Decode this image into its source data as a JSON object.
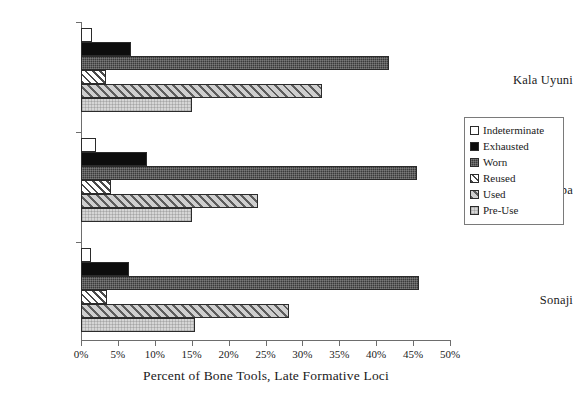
{
  "chart_data": {
    "type": "bar",
    "orientation": "horizontal",
    "title": "",
    "xlabel": "Percent of Bone Tools, Late Formative Loci",
    "ylabel": "",
    "categories": [
      "Kala Uyuni",
      "Kumi Kipa",
      "Sonaji"
    ],
    "xlim": [
      0,
      50
    ],
    "xticks": [
      0,
      5,
      10,
      15,
      20,
      25,
      30,
      35,
      40,
      45,
      50
    ],
    "xtick_labels": [
      "0%",
      "5%",
      "10%",
      "15%",
      "20%",
      "25%",
      "30%",
      "35%",
      "40%",
      "45%",
      "50%"
    ],
    "grid": false,
    "legend_position": "right",
    "series": [
      {
        "name": "Indeterminate",
        "pattern": "open-white",
        "color": "#ffffff",
        "values": [
          1.5,
          2.0,
          1.3
        ]
      },
      {
        "name": "Exhausted",
        "pattern": "solid-black",
        "color": "#0d0d0d",
        "values": [
          6.8,
          9.0,
          6.5
        ]
      },
      {
        "name": "Worn",
        "pattern": "dark-checker",
        "color": "#3a3a3a",
        "values": [
          41.8,
          45.5,
          45.8
        ]
      },
      {
        "name": "Reused",
        "pattern": "diagonal-hatch",
        "color": "#4a4a4a",
        "values": [
          3.4,
          4.0,
          3.5
        ]
      },
      {
        "name": "Used",
        "pattern": "gray-diagonal",
        "color": "#b9b9b9",
        "values": [
          32.6,
          24.0,
          28.2
        ]
      },
      {
        "name": "Pre-Use",
        "pattern": "light-checker",
        "color": "#d6d6d6",
        "values": [
          15.0,
          15.0,
          15.5
        ]
      }
    ]
  }
}
